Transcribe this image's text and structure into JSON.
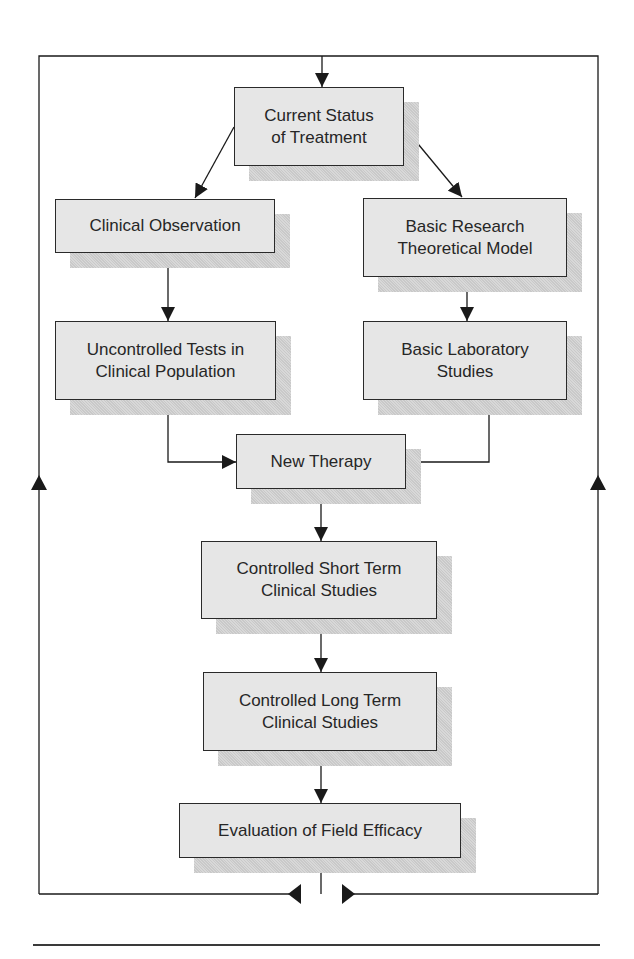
{
  "diagram": {
    "type": "flowchart",
    "colors": {
      "box_fill": "#e6e6e6",
      "box_border": "#2a2a2a",
      "shadow": "#cfcfcf",
      "line": "#1a1a1a",
      "text": "#262626"
    },
    "nodes": [
      {
        "id": "current_status",
        "label": "Current Status\nof Treatment",
        "x": 234,
        "y": 87,
        "w": 170,
        "h": 79
      },
      {
        "id": "clinical_observation",
        "label": "Clinical Observation",
        "x": 55,
        "y": 199,
        "w": 220,
        "h": 54
      },
      {
        "id": "basic_research",
        "label": "Basic Research\nTheoretical Model",
        "x": 363,
        "y": 198,
        "w": 204,
        "h": 79
      },
      {
        "id": "uncontrolled_tests",
        "label": "Uncontrolled Tests in\nClinical Population",
        "x": 55,
        "y": 321,
        "w": 221,
        "h": 79
      },
      {
        "id": "basic_lab",
        "label": "Basic Laboratory\nStudies",
        "x": 363,
        "y": 321,
        "w": 204,
        "h": 79
      },
      {
        "id": "new_therapy",
        "label": "New Therapy",
        "x": 236,
        "y": 434,
        "w": 170,
        "h": 55
      },
      {
        "id": "short_term",
        "label": "Controlled Short Term\nClinical Studies",
        "x": 201,
        "y": 541,
        "w": 236,
        "h": 78
      },
      {
        "id": "long_term",
        "label": "Controlled Long Term\nClinical Studies",
        "x": 203,
        "y": 672,
        "w": 234,
        "h": 79
      },
      {
        "id": "field_efficacy",
        "label": "Evaluation of Field Efficacy",
        "x": 179,
        "y": 803,
        "w": 282,
        "h": 55
      }
    ],
    "edges": [
      {
        "from": "feedback_loop",
        "to": "current_status"
      },
      {
        "from": "current_status",
        "to": "clinical_observation"
      },
      {
        "from": "current_status",
        "to": "basic_research"
      },
      {
        "from": "clinical_observation",
        "to": "uncontrolled_tests"
      },
      {
        "from": "basic_research",
        "to": "basic_lab"
      },
      {
        "from": "uncontrolled_tests",
        "to": "new_therapy"
      },
      {
        "from": "basic_lab",
        "to": "new_therapy"
      },
      {
        "from": "new_therapy",
        "to": "short_term"
      },
      {
        "from": "short_term",
        "to": "long_term"
      },
      {
        "from": "long_term",
        "to": "field_efficacy"
      },
      {
        "from": "field_efficacy",
        "to": "feedback_loop"
      }
    ],
    "feedback_loop": {
      "left_x": 39,
      "right_x": 598,
      "top_y": 56,
      "bottom_y": 894
    }
  }
}
